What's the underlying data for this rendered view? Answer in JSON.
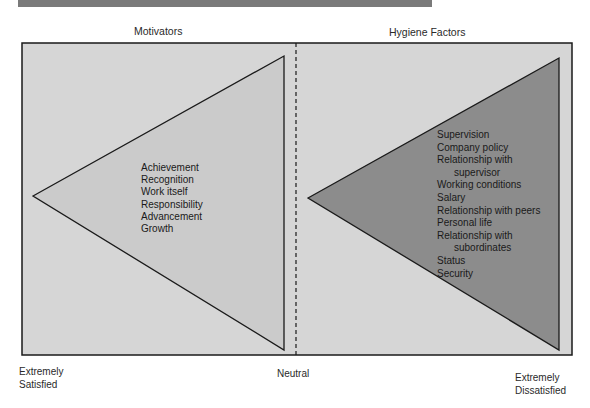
{
  "headings": {
    "left": "Motivators",
    "right": "Hygiene Factors"
  },
  "motivators": {
    "items": [
      "Achievement",
      "Recognition",
      "Work itself",
      "Responsibility",
      "Advancement",
      "Growth"
    ]
  },
  "hygiene_factors": {
    "items": [
      {
        "text": "Supervision",
        "indent": false
      },
      {
        "text": "Company policy",
        "indent": false
      },
      {
        "text": "Relationship with",
        "indent": false
      },
      {
        "text": "supervisor",
        "indent": true
      },
      {
        "text": "Working conditions",
        "indent": false
      },
      {
        "text": "Salary",
        "indent": false
      },
      {
        "text": "Relationship with peers",
        "indent": false
      },
      {
        "text": "Personal life",
        "indent": false
      },
      {
        "text": "Relationship with",
        "indent": false
      },
      {
        "text": "subordinates",
        "indent": true
      },
      {
        "text": "Status",
        "indent": false
      },
      {
        "text": "Security",
        "indent": false
      }
    ]
  },
  "scale": {
    "left_line1": "Extremely",
    "left_line2": "Satisfied",
    "center": "Neutral",
    "right_line1": "Extremely",
    "right_line2": "Dissatisfied"
  },
  "colors": {
    "frame_bg": "#d6d6d6",
    "left_triangle": "#cbcbcb",
    "right_triangle": "#8c8c8c",
    "stroke": "#1a1a1a",
    "topbar": "#7a7a7a"
  }
}
